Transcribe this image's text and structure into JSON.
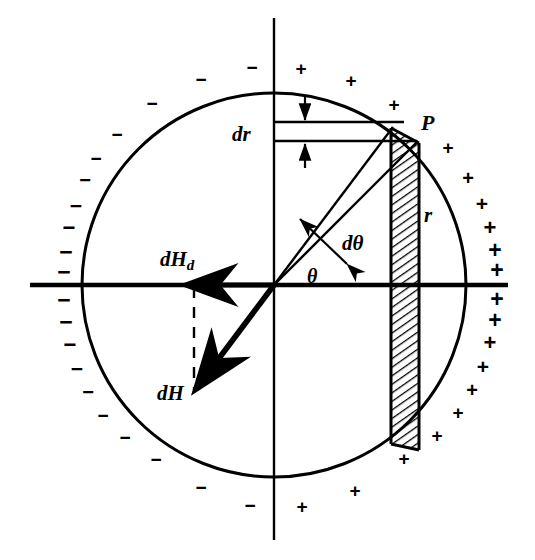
{
  "figure": {
    "background_color": "#ffffff",
    "stroke_color": "#000000"
  },
  "labels": {
    "dr": "dr",
    "point_p": "P",
    "radius": "r",
    "d_theta": "dθ",
    "theta": "θ",
    "dH_d_main": "dH",
    "dH_d_sub": "d",
    "dH": "dH"
  },
  "geometry": {
    "center": {
      "x": 274,
      "y": 285
    },
    "radius": 192,
    "point_p": {
      "x": 409,
      "y": 139
    },
    "theta_degrees": 47,
    "strip_left_x": 391,
    "strip_right_x": 419,
    "dr_top_y": 122,
    "dr_bottom_y": 141,
    "dH_tip": {
      "x": 193,
      "y": 392
    },
    "dHd_tip": {
      "x": 183,
      "y": 285
    }
  },
  "chart_data": {
    "type": "scatter",
    "xlabel": "",
    "ylabel": "",
    "legend": [
      "+",
      "−"
    ],
    "annotations": [
      "dr",
      "P",
      "r",
      "dθ",
      "θ",
      "dH_d",
      "dH"
    ],
    "series": [
      {
        "name": "+",
        "symbol": "+",
        "points": [
          {
            "x": 301,
            "y": 68,
            "size": 19
          },
          {
            "x": 351,
            "y": 80,
            "size": 19
          },
          {
            "x": 394,
            "y": 104,
            "size": 19
          },
          {
            "x": 448,
            "y": 147,
            "size": 19
          },
          {
            "x": 468,
            "y": 178,
            "size": 20
          },
          {
            "x": 482,
            "y": 203,
            "size": 21
          },
          {
            "x": 490,
            "y": 228,
            "size": 22
          },
          {
            "x": 495,
            "y": 250,
            "size": 23
          },
          {
            "x": 497,
            "y": 270,
            "size": 23
          },
          {
            "x": 497,
            "y": 299,
            "size": 23
          },
          {
            "x": 495,
            "y": 320,
            "size": 23
          },
          {
            "x": 490,
            "y": 343,
            "size": 22
          },
          {
            "x": 483,
            "y": 366,
            "size": 21
          },
          {
            "x": 472,
            "y": 390,
            "size": 20
          },
          {
            "x": 458,
            "y": 412,
            "size": 19
          },
          {
            "x": 437,
            "y": 435,
            "size": 19
          },
          {
            "x": 404,
            "y": 458,
            "size": 19
          },
          {
            "x": 355,
            "y": 490,
            "size": 19
          },
          {
            "x": 302,
            "y": 506,
            "size": 19
          }
        ]
      },
      {
        "name": "−",
        "symbol": "−",
        "points": [
          {
            "x": 252,
            "y": 67,
            "size": 19
          },
          {
            "x": 201,
            "y": 79,
            "size": 19
          },
          {
            "x": 152,
            "y": 103,
            "size": 19
          },
          {
            "x": 117,
            "y": 134,
            "size": 19
          },
          {
            "x": 96,
            "y": 158,
            "size": 19
          },
          {
            "x": 85,
            "y": 180,
            "size": 20
          },
          {
            "x": 76,
            "y": 205,
            "size": 21
          },
          {
            "x": 69,
            "y": 228,
            "size": 22
          },
          {
            "x": 66,
            "y": 252,
            "size": 23
          },
          {
            "x": 64,
            "y": 272,
            "size": 23
          },
          {
            "x": 64,
            "y": 300,
            "size": 23
          },
          {
            "x": 66,
            "y": 322,
            "size": 23
          },
          {
            "x": 70,
            "y": 345,
            "size": 22
          },
          {
            "x": 77,
            "y": 368,
            "size": 21
          },
          {
            "x": 88,
            "y": 392,
            "size": 20
          },
          {
            "x": 103,
            "y": 415,
            "size": 19
          },
          {
            "x": 125,
            "y": 437,
            "size": 19
          },
          {
            "x": 156,
            "y": 459,
            "size": 19
          },
          {
            "x": 201,
            "y": 487,
            "size": 19
          },
          {
            "x": 250,
            "y": 505,
            "size": 19
          }
        ]
      }
    ]
  }
}
